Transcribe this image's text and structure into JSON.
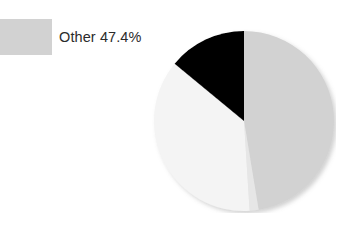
{
  "legend": {
    "items": [
      {
        "label": "Other 47.4%",
        "color": "#d2d2d2",
        "icon": "legend-swatch-icon"
      }
    ]
  },
  "chart_data": {
    "type": "pie",
    "title": "",
    "labels": [
      "Other",
      "Slice B",
      "Slice C",
      "Slice D"
    ],
    "values": [
      47.4,
      1.6,
      37.0,
      14.0
    ],
    "display_values": [
      "47.4%",
      "",
      "",
      ""
    ],
    "colors": [
      "#d2d2d2",
      "#e6e6e6",
      "#f4f4f4",
      "#000000"
    ],
    "start_angle_deg": 0,
    "direction": "clockwise",
    "legend_position": "left",
    "grid": false,
    "xlabel": "",
    "ylabel": "",
    "annotations": []
  },
  "figure": {
    "background_color": "#ffffff",
    "pie_center_x": 244,
    "pie_center_y": 121,
    "pie_radius": 92
  }
}
